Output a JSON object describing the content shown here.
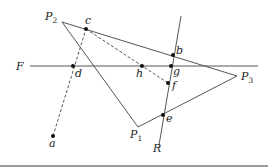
{
  "diagram": {
    "colors": {
      "line": "#555555",
      "dashed": "#444444",
      "point": "#111111",
      "text": "#222222",
      "bottom_bar": "#9a9a9a"
    },
    "triangle": {
      "vertices": [
        {
          "id": "P2",
          "label": "P",
          "sub": "2",
          "x": 62,
          "y": 22
        },
        {
          "id": "P3",
          "label": "P",
          "sub": "3",
          "x": 237,
          "y": 76
        },
        {
          "id": "P1",
          "label": "P",
          "sub": "1",
          "x": 138,
          "y": 127
        }
      ]
    },
    "lines": {
      "F": {
        "label": "F",
        "x1": 30,
        "y1": 66,
        "x2": 258,
        "y2": 66
      },
      "R": {
        "label": "R",
        "x1": 181,
        "y1": 16,
        "x2": 159,
        "y2": 145
      }
    },
    "dashed_lines": [
      {
        "from": "a",
        "to": "c"
      },
      {
        "from": "c",
        "to": "f"
      }
    ],
    "points": [
      {
        "id": "a",
        "label": "a",
        "x": 53,
        "y": 136
      },
      {
        "id": "b",
        "label": "b",
        "x": 173,
        "y": 55
      },
      {
        "id": "c",
        "label": "c",
        "x": 86,
        "y": 29
      },
      {
        "id": "d",
        "label": "d",
        "x": 73,
        "y": 66
      },
      {
        "id": "e",
        "label": "e",
        "x": 163,
        "y": 115
      },
      {
        "id": "f",
        "label": "f",
        "x": 168,
        "y": 83
      },
      {
        "id": "g",
        "label": "g",
        "x": 171,
        "y": 66
      },
      {
        "id": "h",
        "label": "h",
        "x": 142,
        "y": 66
      }
    ]
  }
}
